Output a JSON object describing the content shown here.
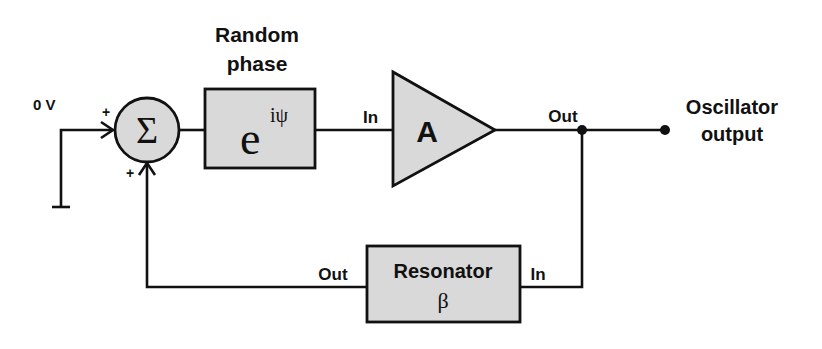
{
  "diagram": {
    "type": "block-diagram",
    "input": {
      "label": "0 V"
    },
    "summer": {
      "symbol": "Σ",
      "input_signs": [
        "+",
        "+"
      ]
    },
    "phase_block": {
      "title_line1": "Random",
      "title_line2": "phase",
      "base": "e",
      "exponent": "iψ"
    },
    "amplifier": {
      "symbol": "A",
      "in_label": "In",
      "out_label": "Out"
    },
    "resonator": {
      "title": "Resonator",
      "symbol": "β",
      "in_label": "In",
      "out_label": "Out"
    },
    "output": {
      "line1": "Oscillator",
      "line2": "output"
    }
  },
  "colors": {
    "block_fill": "#d9d9d9",
    "stroke": "#111111",
    "background": "#ffffff"
  }
}
